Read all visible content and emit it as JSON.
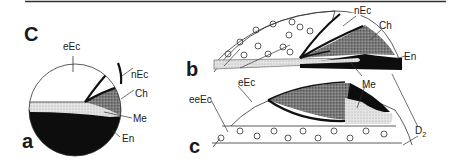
{
  "figure": {
    "panel_labels": {
      "upper_left": "C",
      "a": "a",
      "b": "b",
      "c": "c"
    },
    "tissue_labels": {
      "eEc": "eEc",
      "eeEc": "eeEc",
      "nEc": "nEc",
      "Ch": "Ch",
      "Me": "Me",
      "En": "En",
      "D2_main": "D",
      "D2_sub": "2"
    },
    "legend": {
      "eEc": "white (unfilled)",
      "eeEc": "white with open circles",
      "nEc": "white outlined by heavy black line",
      "Ch": "dark stipple",
      "Me": "light stipple",
      "En": "solid black"
    },
    "colors": {
      "line": "#1a1a1a",
      "En": "#0d0d0d",
      "Ch": "#6e6e6e",
      "Me": "#dcdcdc",
      "background": "#ffffff"
    }
  }
}
